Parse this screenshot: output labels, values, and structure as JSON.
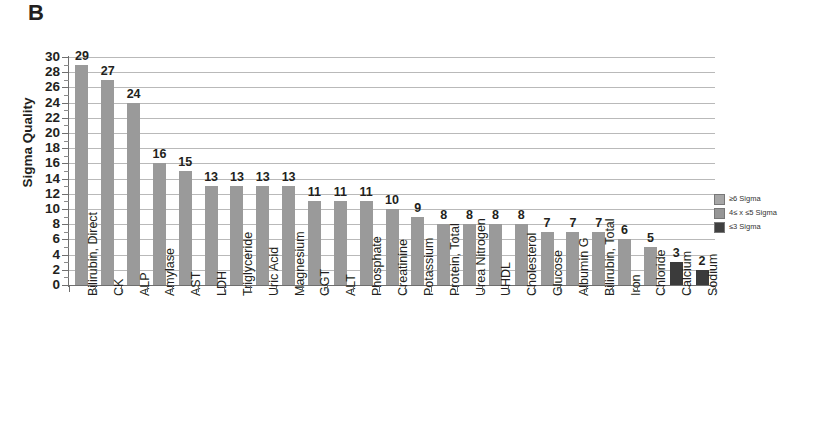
{
  "panel": {
    "letter": "B"
  },
  "chart_data": {
    "type": "bar",
    "title": "",
    "xlabel": "",
    "ylabel": "Sigma Quality",
    "ylim": [
      0,
      30
    ],
    "ytick_step": 2,
    "yticks": [
      30,
      28,
      26,
      24,
      22,
      20,
      18,
      16,
      14,
      12,
      10,
      8,
      6,
      4,
      2,
      0
    ],
    "grid": "horizontal",
    "legend_position": "right",
    "categories": [
      "Bilirubin, Direct",
      "CK",
      "ALP",
      "Amylase",
      "AST",
      "LDH",
      "Triglyceride",
      "Uric Acid",
      "Magnesium",
      "GGT",
      "ALT",
      "Phosphate",
      "Creatinine",
      "Potassium",
      "Protein, Total",
      "Urea Nitrogen",
      "UHDL",
      "Cholesterol",
      "Glucose",
      "Albumin G",
      "Bilirubin, Total",
      "Iron",
      "Chloride",
      "Calcium",
      "Sodium"
    ],
    "values": [
      29,
      27,
      24,
      16,
      15,
      13,
      13,
      13,
      13,
      11,
      11,
      11,
      10,
      9,
      8,
      8,
      8,
      8,
      7,
      7,
      7,
      6,
      5,
      3,
      2
    ],
    "point_groups": [
      "high",
      "high",
      "high",
      "high",
      "high",
      "high",
      "high",
      "high",
      "high",
      "high",
      "high",
      "high",
      "high",
      "high",
      "high",
      "high",
      "high",
      "high",
      "high",
      "high",
      "high",
      "high",
      "high",
      "low",
      "low"
    ],
    "data_labels": [
      "29",
      "27",
      "24",
      "16",
      "15",
      "13",
      "13",
      "13",
      "13",
      "11",
      "11",
      "11",
      "10",
      "9",
      "8",
      "8",
      "8",
      "8",
      "7",
      "7",
      "7",
      "6",
      "5",
      "3",
      "2"
    ]
  },
  "legend": {
    "items": [
      {
        "label": "≥6 Sigma",
        "color": "#a6a6a6"
      },
      {
        "label": "4≤ x ≤5 Sigma",
        "color": "#969696"
      },
      {
        "label": "≤3 Sigma",
        "color": "#404040"
      }
    ]
  },
  "colors": {
    "bar_high": "#9a9a9a",
    "bar_low": "#3b3b3b",
    "gridline": "#b9b9b9",
    "axis": "#6f6f6f",
    "text": "#231f20"
  },
  "caption": {
    "sliver": ""
  }
}
